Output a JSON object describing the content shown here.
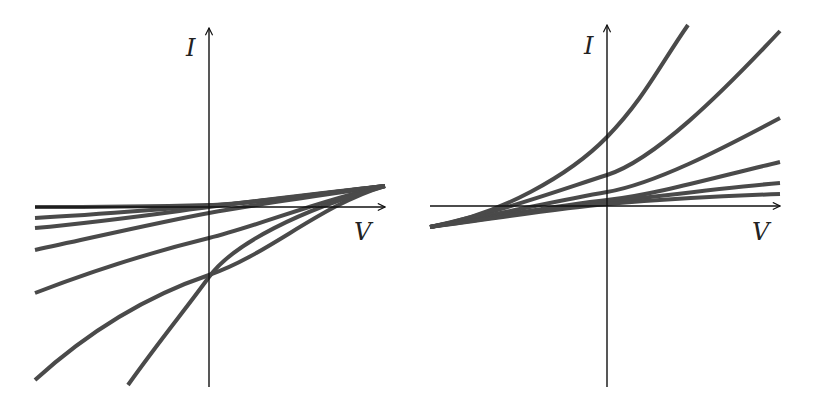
{
  "colors": {
    "background": "#ffffff",
    "axis": "#111111",
    "curve": "#4a4a4a",
    "label": "#222222"
  },
  "panels": [
    {
      "id": "left",
      "y_axis_label": "I",
      "x_axis_label": "V",
      "description": "Family of I-V curves converging at upper right, fanning downward to the left",
      "axes": {
        "origin": [
          209,
          207
        ],
        "x_axis": {
          "x1": 35,
          "x2": 385,
          "y": 207
        },
        "y_axis": {
          "x": 209,
          "y1": 387,
          "y2": 28
        }
      },
      "label_positions": {
        "I": [
          186,
          56
        ],
        "V": [
          354,
          240
        ]
      },
      "curves": [
        {
          "name": "curve-1",
          "d": "M 35 207 C 120 207, 170 206, 209 205 S 330 192, 385 186"
        },
        {
          "name": "curve-2",
          "d": "M 35 218 C 110 214, 170 208, 209 206 S 330 192, 385 186"
        },
        {
          "name": "curve-3",
          "d": "M 35 228 C 110 221, 170 212, 209 207 S 330 192, 385 186"
        },
        {
          "name": "curve-4",
          "d": "M 35 250 C 100 236, 160 222, 209 213 S 330 194, 385 186"
        },
        {
          "name": "curve-5",
          "d": "M 35 293 C 100 268, 160 250, 209 238 S 320 200, 385 186"
        },
        {
          "name": "curve-6",
          "d": "M 35 380 C 90 330, 150 295, 209 275 S 320 205, 385 186"
        },
        {
          "name": "curve-7",
          "d": "M 128 385 C 160 340, 185 310, 209 277 S 300 210, 385 186"
        }
      ]
    },
    {
      "id": "right",
      "y_axis_label": "I",
      "x_axis_label": "V",
      "description": "Family of I-V curves converging at lower left, fanning upward to the right",
      "axes": {
        "origin": [
          607,
          206
        ],
        "x_axis": {
          "x1": 430,
          "x2": 780,
          "y": 206
        },
        "y_axis": {
          "x": 607,
          "y1": 387,
          "y2": 25
        }
      },
      "label_positions": {
        "I": [
          584,
          54
        ],
        "V": [
          752,
          240
        ]
      },
      "curves": [
        {
          "name": "curve-1",
          "d": "M 430 227 C 500 215, 570 175, 607 137 S 660 65, 688 25"
        },
        {
          "name": "curve-2",
          "d": "M 430 227 C 500 212, 560 190, 607 175 S 720 95, 780 31"
        },
        {
          "name": "curve-3",
          "d": "M 430 227 C 500 214, 560 200, 607 192 S 720 150, 780 118"
        },
        {
          "name": "curve-4",
          "d": "M 430 227 C 500 216, 560 205, 607 200 S 720 176, 780 162"
        },
        {
          "name": "curve-5",
          "d": "M 430 227 C 500 217, 560 207, 607 202 S 720 188, 780 183"
        },
        {
          "name": "curve-6",
          "d": "M 430 227 C 500 218, 560 208, 607 204 S 720 196, 780 194"
        }
      ]
    }
  ]
}
